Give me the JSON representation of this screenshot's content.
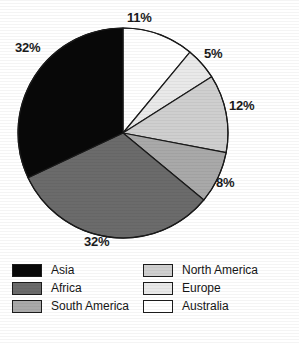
{
  "chart_data": {
    "type": "pie",
    "title": "",
    "subtitle": "",
    "xlabel": "",
    "ylabel": "",
    "grid": false,
    "legend_position": "bottom",
    "unit": "%",
    "start_angle_deg": 0,
    "direction": "clockwise",
    "categories": [
      "Australia",
      "Europe",
      "North America",
      "South America",
      "Africa",
      "Asia"
    ],
    "values": [
      11,
      5,
      12,
      8,
      32,
      32
    ],
    "slices": [
      {
        "name": "Australia",
        "value": 11,
        "label": "11%",
        "color": "#ffffff",
        "start_deg": 0,
        "end_deg": 39.6,
        "label_pos": {
          "x": 127,
          "y": 11
        }
      },
      {
        "name": "Europe",
        "value": 5,
        "label": "5%",
        "color": "#e9e9e9",
        "start_deg": 39.6,
        "end_deg": 57.6,
        "label_pos": {
          "x": 204,
          "y": 47
        }
      },
      {
        "name": "North America",
        "value": 12,
        "label": "12%",
        "color": "#cfcfcf",
        "start_deg": 57.6,
        "end_deg": 100.8,
        "label_pos": {
          "x": 229,
          "y": 99
        }
      },
      {
        "name": "South America",
        "value": 8,
        "label": "8%",
        "color": "#a9a9a9",
        "start_deg": 100.8,
        "end_deg": 129.6,
        "label_pos": {
          "x": 216,
          "y": 176
        }
      },
      {
        "name": "Africa",
        "value": 32,
        "label": "32%",
        "color": "#6b6b6b",
        "start_deg": 129.6,
        "end_deg": 244.8,
        "label_pos": {
          "x": 84,
          "y": 235
        }
      },
      {
        "name": "Asia",
        "value": 32,
        "label": "32%",
        "color": "#080808",
        "start_deg": 244.8,
        "end_deg": 360,
        "label_pos": {
          "x": 15,
          "y": 41
        }
      }
    ],
    "geometry": {
      "center_x": 123,
      "center_y": 133,
      "radius": 105,
      "outline_color": "#1a1a1a",
      "outline_width": 1.2
    }
  },
  "legend": {
    "columns": [
      {
        "items": [
          {
            "label": "Asia",
            "color": "#080808",
            "swatch_name": "legend-swatch-asia"
          },
          {
            "label": "Africa",
            "color": "#6b6b6b",
            "swatch_name": "legend-swatch-africa"
          },
          {
            "label": "South America",
            "color": "#a9a9a9",
            "swatch_name": "legend-swatch-south-america"
          }
        ]
      },
      {
        "items": [
          {
            "label": "North America",
            "color": "#cfcfcf",
            "swatch_name": "legend-swatch-north-america"
          },
          {
            "label": "Europe",
            "color": "#e9e9e9",
            "swatch_name": "legend-swatch-europe"
          },
          {
            "label": "Australia",
            "color": "#ffffff",
            "swatch_name": "legend-swatch-australia"
          }
        ]
      }
    ]
  }
}
